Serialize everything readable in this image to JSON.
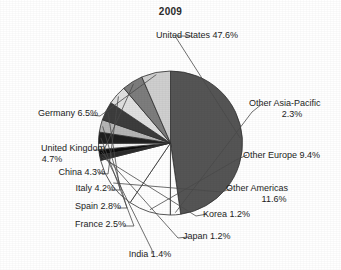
{
  "chart_data": {
    "type": "pie",
    "title": "2009",
    "xlabel": "",
    "ylabel": "",
    "legend_position": "none",
    "labels_outside": true,
    "start_angle_deg": 0,
    "direction": "clockwise",
    "categories": [
      "United States",
      "Other Asia-Pacific",
      "Other Europe",
      "Other Americas",
      "Korea",
      "Japan",
      "India",
      "France",
      "Spain",
      "Italy",
      "China",
      "United Kingdom",
      "Germany"
    ],
    "values": [
      47.6,
      2.3,
      9.4,
      11.6,
      1.2,
      1.2,
      1.4,
      2.5,
      2.8,
      4.2,
      4.3,
      4.7,
      6.5
    ],
    "unit": "%",
    "total": 100.0,
    "slice_colors": [
      "#555555",
      "#ffffff",
      "#ffffff",
      "#ffffff",
      "#2a2a2a",
      "#0d0d0d",
      "#f2f2f2",
      "#1f1f1f",
      "#b6b6b6",
      "#3d3d3d",
      "#e0e0e0",
      "#7d7d7d",
      "#cfcfcf"
    ],
    "annotations": [
      {
        "name": "United States",
        "text": "United States 47.6%"
      },
      {
        "name": "Other Asia-Pacific",
        "text": "Other Asia-Pacific",
        "text2": "2.3%"
      },
      {
        "name": "Other Europe",
        "text": "Other Europe 9.4%"
      },
      {
        "name": "Other Americas",
        "text": "Other Americas",
        "text2": "11.6%"
      },
      {
        "name": "Korea",
        "text": "Korea 1.2%"
      },
      {
        "name": "Japan",
        "text": "Japan 1.2%"
      },
      {
        "name": "India",
        "text": "India 1.4%"
      },
      {
        "name": "France",
        "text": "France 2.5%"
      },
      {
        "name": "Spain",
        "text": "Spain 2.8%"
      },
      {
        "name": "Italy",
        "text": "Italy 4.2%"
      },
      {
        "name": "China",
        "text": "China 4.3%"
      },
      {
        "name": "United Kingdom",
        "text": "United Kingdom",
        "text2": "4.7%"
      },
      {
        "name": "Germany",
        "text": "Germany 6.5%"
      }
    ]
  },
  "labels": {
    "united_states": "United States 47.6%",
    "other_asia_pacific_l1": "Other Asia-Pacific",
    "other_asia_pacific_l2": "2.3%",
    "other_europe": "Other Europe 9.4%",
    "other_americas_l1": "Other Americas",
    "other_americas_l2": "11.6%",
    "korea": "Korea 1.2%",
    "japan": "Japan 1.2%",
    "india": "India 1.4%",
    "france": "France 2.5%",
    "spain": "Spain 2.8%",
    "italy": "Italy 4.2%",
    "china": "China 4.3%",
    "united_kingdom_l1": "United Kingdom",
    "united_kingdom_l2": "4.7%",
    "germany": "Germany 6.5%"
  }
}
